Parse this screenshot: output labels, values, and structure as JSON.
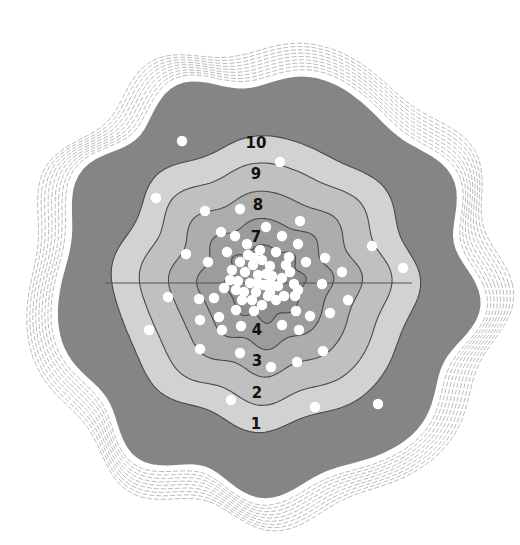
{
  "diagram": {
    "type": "target-contour-diagram",
    "center": [
      265,
      283
    ],
    "divider_y": 283,
    "colors": {
      "background": "#ffffff",
      "hatch": "#9a9a9a",
      "outer_band": "#858585",
      "band_light": "#d2d2d2",
      "band_mid_light": "#c0c0c0",
      "band_mid": "#adadad",
      "band_dark": "#9c9c9c",
      "core": "#8e8e8e",
      "contour_line": "#4a4a4a",
      "divider_line": "#555555",
      "dot": "#ffffff",
      "label": "#111111"
    },
    "rings": [
      {
        "zone": "outer",
        "radius": 205
      },
      {
        "zone": "1-10",
        "radius": 150
      },
      {
        "zone": "2-9",
        "radius": 122
      },
      {
        "zone": "3-8",
        "radius": 93
      },
      {
        "zone": "4-7",
        "radius": 65
      },
      {
        "zone": "5-6",
        "radius": 38
      }
    ],
    "labels": [
      {
        "text": "10",
        "x": 256,
        "y": 143
      },
      {
        "text": "9",
        "x": 256,
        "y": 174
      },
      {
        "text": "8",
        "x": 258,
        "y": 205
      },
      {
        "text": "7",
        "x": 256,
        "y": 237
      },
      {
        "text": "4",
        "x": 257,
        "y": 330
      },
      {
        "text": "3",
        "x": 257,
        "y": 361
      },
      {
        "text": "2",
        "x": 257,
        "y": 393
      },
      {
        "text": "1",
        "x": 256,
        "y": 424
      }
    ],
    "dots": [
      [
        182,
        141
      ],
      [
        280,
        162
      ],
      [
        156,
        198
      ],
      [
        205,
        211
      ],
      [
        240,
        209
      ],
      [
        300,
        221
      ],
      [
        372,
        246
      ],
      [
        403,
        268
      ],
      [
        186,
        254
      ],
      [
        221,
        232
      ],
      [
        235,
        236
      ],
      [
        247,
        244
      ],
      [
        266,
        227
      ],
      [
        282,
        236
      ],
      [
        298,
        244
      ],
      [
        208,
        262
      ],
      [
        227,
        252
      ],
      [
        289,
        257
      ],
      [
        306,
        262
      ],
      [
        342,
        272
      ],
      [
        325,
        258
      ],
      [
        168,
        297
      ],
      [
        199,
        299
      ],
      [
        214,
        298
      ],
      [
        270,
        292
      ],
      [
        295,
        296
      ],
      [
        322,
        284
      ],
      [
        348,
        300
      ],
      [
        149,
        330
      ],
      [
        200,
        320
      ],
      [
        219,
        317
      ],
      [
        236,
        310
      ],
      [
        254,
        311
      ],
      [
        296,
        311
      ],
      [
        310,
        316
      ],
      [
        330,
        313
      ],
      [
        222,
        330
      ],
      [
        241,
        326
      ],
      [
        282,
        325
      ],
      [
        299,
        330
      ],
      [
        200,
        349
      ],
      [
        240,
        353
      ],
      [
        271,
        367
      ],
      [
        297,
        362
      ],
      [
        323,
        351
      ],
      [
        231,
        400
      ],
      [
        315,
        407
      ],
      [
        378,
        404
      ],
      [
        253,
        265
      ],
      [
        262,
        260
      ],
      [
        270,
        266
      ],
      [
        245,
        272
      ],
      [
        258,
        275
      ],
      [
        272,
        276
      ],
      [
        264,
        285
      ],
      [
        250,
        283
      ],
      [
        238,
        281
      ],
      [
        278,
        286
      ],
      [
        256,
        292
      ],
      [
        244,
        292
      ],
      [
        268,
        296
      ],
      [
        282,
        278
      ],
      [
        232,
        270
      ],
      [
        290,
        272
      ],
      [
        260,
        250
      ],
      [
        248,
        255
      ],
      [
        276,
        252
      ],
      [
        240,
        262
      ],
      [
        286,
        265
      ],
      [
        236,
        290
      ],
      [
        252,
        300
      ],
      [
        262,
        305
      ],
      [
        276,
        300
      ],
      [
        230,
        280
      ],
      [
        294,
        284
      ],
      [
        266,
        274
      ],
      [
        254,
        258
      ],
      [
        242,
        300
      ],
      [
        284,
        296
      ],
      [
        224,
        288
      ],
      [
        298,
        290
      ],
      [
        258,
        283
      ],
      [
        270,
        283
      ]
    ],
    "dot_radius": 5.2
  }
}
